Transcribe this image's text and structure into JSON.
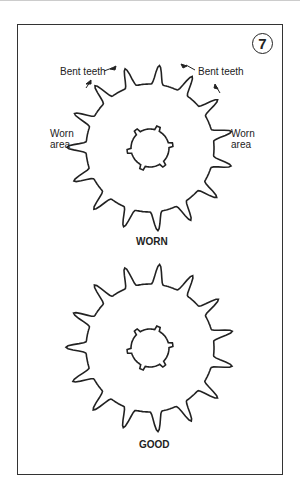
{
  "figure": {
    "number": "7",
    "worn": {
      "caption": "WORN",
      "labels": {
        "bent_teeth_left": "Bent teeth",
        "bent_teeth_right": "Bent teeth",
        "worn_area_left": [
          "Worn",
          "area"
        ],
        "worn_area_right": [
          "Worn",
          "area"
        ]
      },
      "teeth": 15
    },
    "good": {
      "caption": "GOOD",
      "teeth": 15
    },
    "colors": {
      "line": "#222222",
      "frame": "#333333",
      "background": "#ffffff"
    }
  }
}
